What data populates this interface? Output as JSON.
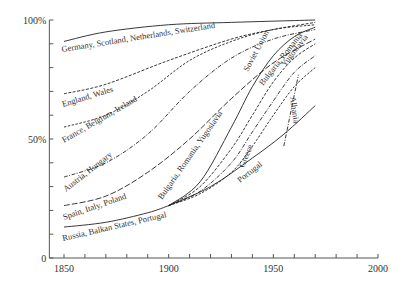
{
  "chart_data": {
    "type": "line",
    "title": "",
    "xlabel": "",
    "ylabel": "",
    "xlim": [
      1843,
      2000
    ],
    "ylim": [
      0,
      100
    ],
    "x_ticks": [
      1850,
      1900,
      1950,
      2000
    ],
    "x_minor_tick_step": 10,
    "y_ticks": [
      {
        "value": 0,
        "label": "0"
      },
      {
        "value": 50,
        "label": "50%"
      },
      {
        "value": 100,
        "label": "100%"
      }
    ],
    "y_minor_tick_step": 10,
    "grid": false,
    "legend": "inline labels",
    "series": [
      {
        "name": "Germany, Scotland, Netherlands, Switzerland",
        "style": "solid",
        "points": [
          [
            1850,
            91
          ],
          [
            1870,
            95
          ],
          [
            1900,
            98
          ],
          [
            1930,
            99
          ],
          [
            1970,
            100
          ]
        ],
        "label_pos": [
          62,
          52
        ],
        "label_angle": -9
      },
      {
        "name": "England, Wales",
        "style": "dashed",
        "points": [
          [
            1850,
            69
          ],
          [
            1870,
            73
          ],
          [
            1900,
            83
          ],
          [
            1930,
            92
          ],
          [
            1950,
            96
          ],
          [
            1970,
            99
          ]
        ],
        "label_pos": [
          63,
          107
        ],
        "label_angle": -17
      },
      {
        "name": "France, Belgium, Ireland",
        "style": "dashed-short",
        "points": [
          [
            1850,
            55
          ],
          [
            1870,
            60
          ],
          [
            1890,
            70
          ],
          [
            1910,
            83
          ],
          [
            1930,
            91
          ],
          [
            1950,
            96
          ],
          [
            1970,
            98
          ]
        ],
        "label_pos": [
          64,
          143
        ],
        "label_angle": -30
      },
      {
        "name": "Austria, Hungary",
        "style": "dash-dot",
        "points": [
          [
            1850,
            34
          ],
          [
            1870,
            40
          ],
          [
            1890,
            52
          ],
          [
            1910,
            70
          ],
          [
            1930,
            84
          ],
          [
            1950,
            92
          ],
          [
            1970,
            96
          ]
        ],
        "label_pos": [
          66,
          192
        ],
        "label_angle": -38
      },
      {
        "name": "Spain, Italy, Poland",
        "style": "long-dash",
        "points": [
          [
            1850,
            22
          ],
          [
            1870,
            26
          ],
          [
            1890,
            36
          ],
          [
            1910,
            50
          ],
          [
            1930,
            67
          ],
          [
            1950,
            82
          ],
          [
            1970,
            92
          ]
        ],
        "label_pos": [
          64,
          220
        ],
        "label_angle": -19
      },
      {
        "name": "Russia, Balkan States, Portugal",
        "style": "solid",
        "points": [
          [
            1850,
            13
          ],
          [
            1870,
            15
          ],
          [
            1890,
            19
          ],
          [
            1900,
            22
          ]
        ],
        "label_pos": [
          63,
          241
        ],
        "label_angle": -13
      },
      {
        "name": "Soviet Union",
        "style": "solid",
        "points": [
          [
            1900,
            22
          ],
          [
            1915,
            32
          ],
          [
            1930,
            55
          ],
          [
            1940,
            72
          ],
          [
            1950,
            85
          ],
          [
            1960,
            93
          ],
          [
            1970,
            97
          ]
        ],
        "label_pos": [
          248,
          72
        ],
        "label_angle": -62
      },
      {
        "name": "Bulgaria, Romania",
        "style": "dashed",
        "points": [
          [
            1900,
            22
          ],
          [
            1915,
            30
          ],
          [
            1930,
            46
          ],
          [
            1940,
            60
          ],
          [
            1950,
            74
          ],
          [
            1960,
            84
          ],
          [
            1970,
            90
          ]
        ],
        "label_pos": [
          263,
          86
        ],
        "label_angle": -52
      },
      {
        "name": "Yugoslavia",
        "style": "dash-dot",
        "points": [
          [
            1900,
            22
          ],
          [
            1915,
            28
          ],
          [
            1930,
            40
          ],
          [
            1940,
            53
          ],
          [
            1950,
            66
          ],
          [
            1960,
            78
          ],
          [
            1970,
            85
          ]
        ],
        "label_pos": [
          285,
          67
        ],
        "label_angle": -52
      },
      {
        "name": "Greece",
        "style": "dashed-short",
        "points": [
          [
            1900,
            22
          ],
          [
            1915,
            27
          ],
          [
            1930,
            36
          ],
          [
            1940,
            47
          ],
          [
            1950,
            60
          ],
          [
            1960,
            72
          ],
          [
            1970,
            80
          ]
        ],
        "label_pos": [
          244,
          168
        ],
        "label_angle": -68
      },
      {
        "name": "Portugal",
        "style": "solid",
        "points": [
          [
            1900,
            22
          ],
          [
            1920,
            30
          ],
          [
            1940,
            42
          ],
          [
            1955,
            52
          ],
          [
            1970,
            64
          ]
        ],
        "label_pos": [
          240,
          183
        ],
        "label_angle": -38
      },
      {
        "name": "Albania",
        "style": "dash-dot",
        "points": [
          [
            1955,
            47
          ],
          [
            1962,
            77
          ]
        ],
        "label_pos": [
          290,
          97
        ],
        "label_angle": 82
      }
    ],
    "inline_labels": {
      "bulgaria_romania_yugoslavia": {
        "text": "Bulgaria, Romania, Yugoslavia",
        "pos": [
          162,
          200
        ],
        "angle": -55
      }
    }
  }
}
